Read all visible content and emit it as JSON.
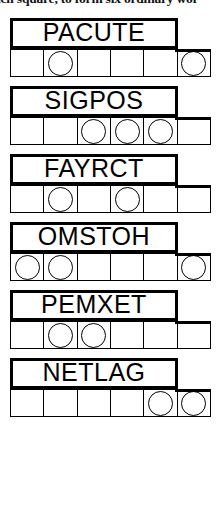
{
  "instruction": {
    "text": "ach square, to form six ordinary wor"
  },
  "puzzle": {
    "type": "jumble-word-puzzle",
    "cells_per_word": 6,
    "blocks": [
      {
        "word": "PACUTE",
        "letters": [
          "P",
          "A",
          "C",
          "U",
          "T",
          "E"
        ],
        "circled_positions": [
          2,
          6
        ]
      },
      {
        "word": "SIGPOS",
        "letters": [
          "S",
          "I",
          "G",
          "P",
          "O",
          "S"
        ],
        "circled_positions": [
          3,
          4,
          5
        ]
      },
      {
        "word": "FAYRCT",
        "letters": [
          "F",
          "A",
          "Y",
          "R",
          "C",
          "T"
        ],
        "circled_positions": [
          2,
          4
        ]
      },
      {
        "word": "OMSTOH",
        "letters": [
          "O",
          "M",
          "S",
          "T",
          "O",
          "H"
        ],
        "circled_positions": [
          1,
          2,
          6
        ]
      },
      {
        "word": "PEMXET",
        "letters": [
          "P",
          "E",
          "M",
          "X",
          "E",
          "T"
        ],
        "circled_positions": [
          2,
          3
        ]
      },
      {
        "word": "NETLAG",
        "letters": [
          "N",
          "E",
          "T",
          "L",
          "A",
          "G"
        ],
        "circled_positions": [
          5,
          6
        ]
      }
    ]
  },
  "colors": {
    "ink": "#000000",
    "paper": "#ffffff"
  }
}
